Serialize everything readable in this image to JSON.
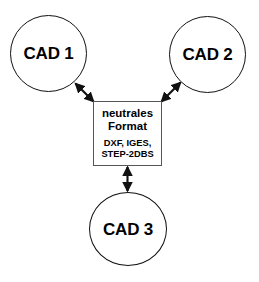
{
  "diagram": {
    "type": "star-topology-exchange-diagram",
    "background_color": "#ffffff",
    "stroke_color": "#111111",
    "box_stroke_color": "#555555",
    "nodes": [
      {
        "id": "cad1",
        "label": "CAD 1",
        "shape": "circle"
      },
      {
        "id": "cad2",
        "label": "CAD 2",
        "shape": "circle"
      },
      {
        "id": "cad3",
        "label": "CAD 3",
        "shape": "circle"
      }
    ],
    "hub": {
      "shape": "rectangle",
      "title_lines": [
        "neutrales",
        "Format"
      ],
      "subtitle_lines": [
        "DXF, IGES,",
        "STEP-2DBS"
      ]
    },
    "connectors": [
      {
        "id": "cad1-hub",
        "from": "cad1",
        "to": "hub",
        "style": "double-headed-arrow"
      },
      {
        "id": "cad2-hub",
        "from": "cad2",
        "to": "hub",
        "style": "double-headed-arrow"
      },
      {
        "id": "cad3-hub",
        "from": "cad3",
        "to": "hub",
        "style": "double-headed-arrow"
      }
    ]
  }
}
